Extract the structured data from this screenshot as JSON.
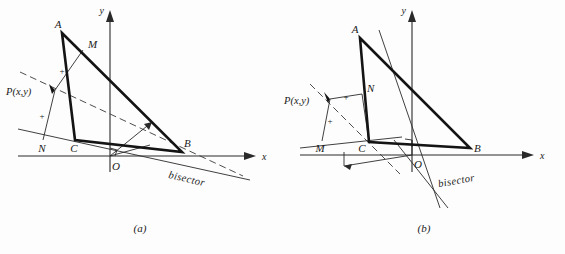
{
  "figure": {
    "background_color": "#fdfdfd",
    "ink_color": "#141414"
  },
  "panels": [
    {
      "id": "a",
      "caption": "(a)",
      "axes": {
        "x_label": "x",
        "y_label": "y",
        "origin_label": "O"
      },
      "labels": {
        "vertex_a": "A",
        "vertex_b": "B",
        "vertex_c": "C",
        "foot_m": "M",
        "foot_n": "N",
        "point_p": "P(x,y)",
        "bisector": "bisector",
        "tick_upper": "+",
        "tick_lower": "+"
      },
      "geometry": {
        "A": [
          62,
          33
        ],
        "B": [
          182,
          152
        ],
        "C": [
          75,
          140
        ],
        "O": [
          110,
          156
        ],
        "M": [
          83,
          50
        ],
        "N": [
          43,
          140
        ],
        "P": [
          55,
          90
        ],
        "x_axis": [
          [
            18,
            156
          ],
          [
            252,
            156
          ]
        ],
        "y_axis": [
          [
            110,
            170
          ],
          [
            110,
            14
          ]
        ],
        "bisector_dashed": [
          [
            20,
            72
          ],
          [
            243,
            176
          ]
        ],
        "bisector_solid": [
          [
            18,
            129
          ],
          [
            247,
            179
          ]
        ]
      }
    },
    {
      "id": "b",
      "caption": "(b)",
      "axes": {
        "x_label": "x",
        "y_label": "y",
        "origin_label": "O"
      },
      "labels": {
        "vertex_a": "A",
        "vertex_b": "B",
        "vertex_c": "C",
        "foot_m": "M",
        "foot_n": "N",
        "point_p": "P(x,y)",
        "bisector": "bisector",
        "tick_upper": "+",
        "tick_lower": "+"
      },
      "geometry": {
        "A": [
          78,
          38
        ],
        "B": [
          188,
          148
        ],
        "C": [
          87,
          142
        ],
        "O": [
          130,
          155
        ],
        "M": [
          40,
          139
        ],
        "N": [
          80,
          96
        ],
        "P": [
          48,
          99
        ],
        "x_axis": [
          [
            18,
            155
          ],
          [
            252,
            155
          ]
        ],
        "y_axis": [
          [
            130,
            170
          ],
          [
            130,
            14
          ]
        ],
        "bisector_dashed": [
          [
            28,
            84
          ],
          [
            112,
            168
          ]
        ],
        "bisector_solid": [
          [
            97,
            30
          ],
          [
            160,
            210
          ]
        ]
      }
    }
  ]
}
